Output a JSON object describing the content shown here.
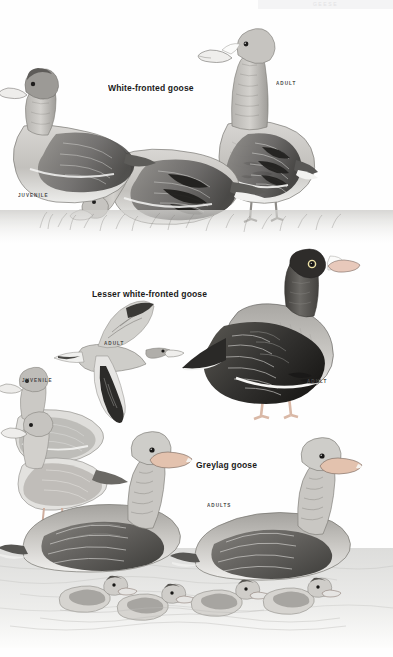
{
  "page": {
    "background_color": "#fefefe",
    "ink_color": "#1b1b1b",
    "running_header": "GEESE"
  },
  "plates": [
    {
      "id": "white-fronted-goose",
      "species_label": "White-fronted goose",
      "label_x": 108,
      "label_y": 82,
      "age_labels": [
        {
          "text": "ADULT",
          "x": 276,
          "y": 80
        },
        {
          "text": "JUVENILE",
          "x": 18,
          "y": 192
        }
      ]
    },
    {
      "id": "lesser-white-fronted-goose",
      "species_label": "Lesser white-fronted goose",
      "label_x": 92,
      "label_y": 288,
      "age_labels": [
        {
          "text": "ADULT",
          "x": 104,
          "y": 340
        },
        {
          "text": "JUVENILE",
          "x": 22,
          "y": 377
        },
        {
          "text": "ADULT",
          "x": 307,
          "y": 378
        }
      ]
    },
    {
      "id": "greylag-goose",
      "species_label": "Greylag goose",
      "label_x": 196,
      "label_y": 459,
      "age_labels": [
        {
          "text": "ADULTS",
          "x": 207,
          "y": 502
        }
      ]
    }
  ],
  "palette": {
    "paper": "#fefefe",
    "wash_light": "#e9e8e6",
    "wash_mid": "#b9b7b4",
    "wash_dark": "#6e6c69",
    "ink_black": "#2b2a28",
    "water": "#dcdcdb",
    "grass": "#c9c8c5"
  }
}
